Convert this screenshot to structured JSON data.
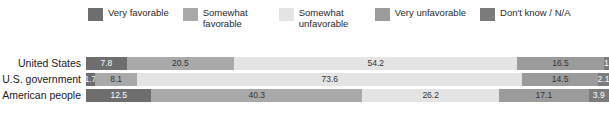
{
  "chart_data": {
    "type": "bar",
    "subtype": "stacked-horizontal-100pct",
    "title": "",
    "subtitle": "",
    "xlabel": "",
    "ylabel": "",
    "xlim": [
      0,
      100
    ],
    "grid": false,
    "legend_position": "top",
    "categories": [
      "United States",
      "U.S. government",
      "American people"
    ],
    "series": [
      {
        "name": "Very favorable",
        "color": "#6e6e6e",
        "values": [
          7.8,
          1.7,
          12.5
        ],
        "labels": [
          "7.8",
          "1.7",
          "12.5"
        ]
      },
      {
        "name": "Somewhat favorable",
        "color": "#a9a9a9",
        "values": [
          20.5,
          8.1,
          40.3
        ],
        "labels": [
          "20.5",
          "8.1",
          "40.3"
        ]
      },
      {
        "name": "Somewhat unfavorable",
        "color": "#e4e4e4",
        "values": [
          54.2,
          73.6,
          26.2
        ],
        "labels": [
          "54.2",
          "73.6",
          "26.2"
        ]
      },
      {
        "name": "Very unfavorable",
        "color": "#9b9b9b",
        "values": [
          16.5,
          14.5,
          17.1
        ],
        "labels": [
          "16.5",
          "14.5",
          "17.1"
        ]
      },
      {
        "name": "Don't know / N/A",
        "color": "#7b7b7b",
        "values": [
          1.0,
          2.1,
          3.9
        ],
        "labels": [
          "1",
          "2.1",
          "3.9"
        ]
      }
    ]
  },
  "legend": {
    "items": [
      {
        "label": "Very favorable",
        "color": "#6e6e6e",
        "icon": "legend-swatch-icon"
      },
      {
        "label": "Somewhat favorable",
        "color": "#a9a9a9",
        "icon": "legend-swatch-icon"
      },
      {
        "label": "Somewhat unfavorable",
        "color": "#e4e4e4",
        "icon": "legend-swatch-icon"
      },
      {
        "label": "Very unfavorable",
        "color": "#9b9b9b",
        "icon": "legend-swatch-icon"
      },
      {
        "label": "Don't know / N/A",
        "color": "#7b7b7b",
        "icon": "legend-swatch-icon"
      }
    ]
  },
  "rows": [
    {
      "label": "United States",
      "segments": [
        {
          "series": "Very favorable",
          "value": 7.8,
          "label": "7.8",
          "color": "#6e6e6e",
          "text": "light"
        },
        {
          "series": "Somewhat favorable",
          "value": 20.5,
          "label": "20.5",
          "color": "#a9a9a9",
          "text": "dark"
        },
        {
          "series": "Somewhat unfavorable",
          "value": 54.2,
          "label": "54.2",
          "color": "#e4e4e4",
          "text": "dark"
        },
        {
          "series": "Very unfavorable",
          "value": 16.5,
          "label": "16.5",
          "color": "#9b9b9b",
          "text": "dark"
        },
        {
          "series": "Don't know / N/A",
          "value": 1.0,
          "label": "1",
          "color": "#7b7b7b",
          "text": "light"
        }
      ]
    },
    {
      "label": "U.S. government",
      "segments": [
        {
          "series": "Very favorable",
          "value": 1.7,
          "label": "1.7",
          "color": "#6e6e6e",
          "text": "light"
        },
        {
          "series": "Somewhat favorable",
          "value": 8.1,
          "label": "8.1",
          "color": "#a9a9a9",
          "text": "dark"
        },
        {
          "series": "Somewhat unfavorable",
          "value": 73.6,
          "label": "73.6",
          "color": "#e4e4e4",
          "text": "dark"
        },
        {
          "series": "Very unfavorable",
          "value": 14.5,
          "label": "14.5",
          "color": "#9b9b9b",
          "text": "dark"
        },
        {
          "series": "Don't know / N/A",
          "value": 2.1,
          "label": "2.1",
          "color": "#7b7b7b",
          "text": "light"
        }
      ]
    },
    {
      "label": "American people",
      "segments": [
        {
          "series": "Very favorable",
          "value": 12.5,
          "label": "12.5",
          "color": "#6e6e6e",
          "text": "light"
        },
        {
          "series": "Somewhat favorable",
          "value": 40.3,
          "label": "40.3",
          "color": "#a9a9a9",
          "text": "dark"
        },
        {
          "series": "Somewhat unfavorable",
          "value": 26.2,
          "label": "26.2",
          "color": "#e4e4e4",
          "text": "dark"
        },
        {
          "series": "Very unfavorable",
          "value": 17.1,
          "label": "17.1",
          "color": "#9b9b9b",
          "text": "dark"
        },
        {
          "series": "Don't know / N/A",
          "value": 3.9,
          "label": "3.9",
          "color": "#7b7b7b",
          "text": "light"
        }
      ]
    }
  ]
}
